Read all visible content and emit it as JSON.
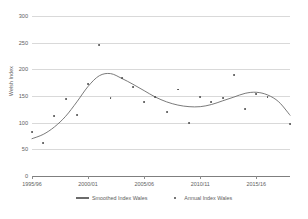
{
  "chart_data": {
    "type": "line",
    "title": "",
    "xlabel": "",
    "ylabel": "Welsh Index",
    "ylim": [
      0,
      300
    ],
    "yticks": [
      0,
      50,
      100,
      150,
      200,
      250,
      300
    ],
    "grid": true,
    "legend_position": "bottom",
    "x": [
      "1995/96",
      "1996/97",
      "1997/98",
      "1998/99",
      "1999/00",
      "2000/01",
      "2001/02",
      "2002/03",
      "2003/04",
      "2004/05",
      "2005/06",
      "2006/07",
      "2007/08",
      "2008/09",
      "2009/10",
      "2010/11",
      "2011/12",
      "2012/13",
      "2013/14",
      "2014/15",
      "2015/16",
      "2016/17",
      "2017/18",
      "2018/19"
    ],
    "xticks": [
      "1995/96",
      "2000/01",
      "2005/06",
      "2010/11",
      "2015/16"
    ],
    "xtick_indices": [
      0,
      5,
      10,
      15,
      20
    ],
    "series": [
      {
        "name": "Smoothed Index Wales",
        "type": "line",
        "color": "#6b6b6b",
        "values": [
          70,
          78,
          92,
          112,
          139,
          168,
          188,
          192,
          183,
          172,
          160,
          148,
          139,
          133,
          130,
          130,
          134,
          141,
          148,
          155,
          157,
          152,
          139,
          114
        ]
      },
      {
        "name": "Annual Index Wales",
        "type": "scatter",
        "color": "#4a4a4a",
        "values": [
          82,
          61,
          112,
          144,
          114,
          173,
          245,
          146,
          184,
          167,
          139,
          148,
          120,
          162,
          100,
          148,
          138,
          146,
          190,
          125,
          154,
          148,
          null,
          97
        ]
      }
    ]
  },
  "legend": {
    "items": [
      {
        "label": "Smoothed Index Wales",
        "marker": "line"
      },
      {
        "label": "Annual Index Wales",
        "marker": "dot"
      }
    ]
  }
}
